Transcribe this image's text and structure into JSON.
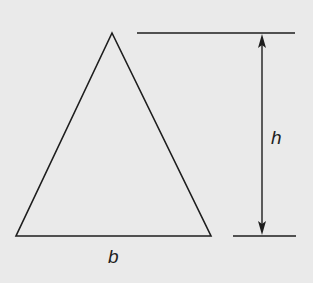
{
  "diagram": {
    "type": "triangle-area-figure",
    "background_color": "#eaeaea",
    "stroke_color": "#1e1e1e",
    "triangle": {
      "apex": [
        112,
        33
      ],
      "base_left": [
        16,
        236
      ],
      "base_right": [
        211,
        236
      ]
    },
    "height_guides": {
      "top_line": {
        "x1": 137,
        "x2": 295,
        "y": 33
      },
      "bottom_line": {
        "x1": 233,
        "x2": 296,
        "y": 236
      },
      "arrow_x": 262
    },
    "labels": {
      "base": "b",
      "height": "h"
    }
  }
}
